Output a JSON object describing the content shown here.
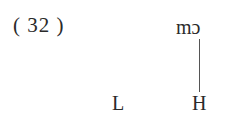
{
  "example": {
    "number_label": "( 32 )"
  },
  "tier_segmental": {
    "syllable": "mɔ"
  },
  "tier_tonal": {
    "tones": [
      "L",
      "H"
    ]
  },
  "associations": [
    {
      "from": "mɔ",
      "to": "H",
      "style": "solid"
    }
  ]
}
